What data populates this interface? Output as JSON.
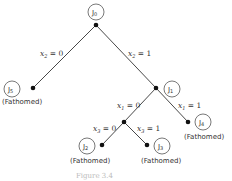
{
  "diagram": {
    "type": "branch-and-bound-tree",
    "nodes": [
      {
        "id": "J0",
        "label": "J0",
        "circle": [
          96,
          12
        ],
        "dot": [
          96,
          25
        ],
        "status": ""
      },
      {
        "id": "J5",
        "label": "J5",
        "circle": [
          12,
          89
        ],
        "dot": [
          33,
          88
        ],
        "status": "(Fathomed)",
        "status_pos": [
          2,
          104
        ]
      },
      {
        "id": "J1",
        "label": "J1",
        "circle": [
          172,
          89
        ],
        "dot": [
          156,
          88
        ],
        "status": ""
      },
      {
        "id": "N",
        "label": "",
        "circle": null,
        "dot": [
          124,
          122
        ],
        "status": ""
      },
      {
        "id": "J4",
        "label": "J4",
        "circle": [
          203,
          122
        ],
        "dot": [
          188,
          122
        ],
        "status": "(Fathomed)",
        "status_pos": [
          184,
          139
        ]
      },
      {
        "id": "J2",
        "label": "J2",
        "circle": [
          87,
          146
        ],
        "dot": [
          102,
          145
        ],
        "status": "(Fathomed)",
        "status_pos": [
          70,
          163
        ]
      },
      {
        "id": "J3",
        "label": "J3",
        "circle": [
          162,
          146
        ],
        "dot": [
          147,
          145
        ],
        "status": "(Fathomed)",
        "status_pos": [
          141,
          163
        ]
      }
    ],
    "edges": [
      {
        "from": "J0",
        "to": "J5",
        "label": "x2 = 0",
        "var": "x",
        "sub": "2",
        "val": "= 0",
        "pos": [
          40,
          56
        ]
      },
      {
        "from": "J0",
        "to": "J1",
        "label": "x2 = 1",
        "var": "x",
        "sub": "2",
        "val": "= 1",
        "pos": [
          128,
          56
        ]
      },
      {
        "from": "J1",
        "to": "N",
        "label": "x1 = 0",
        "var": "x",
        "sub": "1",
        "val": "= 0",
        "pos": [
          117,
          108
        ]
      },
      {
        "from": "J1",
        "to": "J4",
        "label": "x1 = 1",
        "var": "x",
        "sub": "1",
        "val": "= 1",
        "pos": [
          178,
          108
        ]
      },
      {
        "from": "N",
        "to": "J2",
        "label": "x3 = 0",
        "var": "x",
        "sub": "3",
        "val": "= 0",
        "pos": [
          93,
          131
        ]
      },
      {
        "from": "N",
        "to": "J3",
        "label": "x3 = 1",
        "var": "x",
        "sub": "3",
        "val": "= 1",
        "pos": [
          137,
          131
        ]
      }
    ],
    "caption": "Figure 3.4"
  }
}
